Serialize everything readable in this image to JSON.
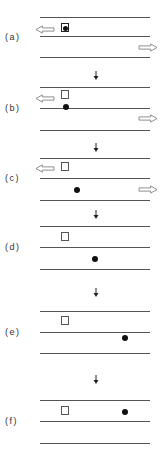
{
  "figure": {
    "panels": [
      {
        "label": "(a)",
        "lines_y": [
          17,
          36,
          57
        ],
        "label_y": 32,
        "box": {
          "x": 61,
          "y": 23,
          "contains_dot": true
        },
        "dot": {
          "x": 63,
          "y": 26
        },
        "left_arrow_y": 25,
        "right_arrow_y": 43
      },
      {
        "label": "(b)",
        "lines_y": [
          87,
          108,
          130
        ],
        "label_y": 103,
        "box": {
          "x": 61,
          "y": 90,
          "contains_dot": false
        },
        "dot": {
          "x": 63,
          "y": 104
        },
        "left_arrow_y": 94,
        "right_arrow_y": 114
      },
      {
        "label": "(c)",
        "lines_y": [
          158,
          178,
          200
        ],
        "label_y": 173,
        "box": {
          "x": 61,
          "y": 162,
          "contains_dot": false
        },
        "dot": {
          "x": 74,
          "y": 187
        },
        "left_arrow_y": 164,
        "right_arrow_y": 185
      },
      {
        "label": "(d)",
        "lines_y": [
          226,
          247,
          269
        ],
        "label_y": 242,
        "box": {
          "x": 61,
          "y": 232,
          "contains_dot": false
        },
        "dot": {
          "x": 92,
          "y": 256
        }
      },
      {
        "label": "(e)",
        "lines_y": [
          311,
          332,
          353
        ],
        "label_y": 327,
        "box": {
          "x": 61,
          "y": 316,
          "contains_dot": false
        },
        "dot": {
          "x": 122,
          "y": 335
        }
      },
      {
        "label": "(f)",
        "lines_y": [
          400,
          421,
          443
        ],
        "label_y": 416,
        "box": {
          "x": 61,
          "y": 406,
          "contains_dot": false
        },
        "dot": {
          "x": 122,
          "y": 409
        }
      }
    ],
    "down_arrows_y": [
      71,
      143,
      210,
      288,
      375
    ],
    "colors": {
      "line": "#555555",
      "dot": "#111111",
      "arrow_outline": "#777777",
      "text": "#333333"
    }
  }
}
